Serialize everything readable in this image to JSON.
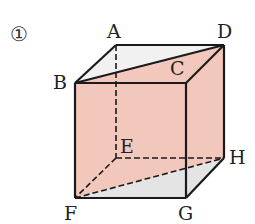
{
  "figure": {
    "number_label": "①",
    "colors": {
      "shaded_plane": "#f2c8bc",
      "grey_face": "#e4e4e4",
      "light_face": "#f1f1f1",
      "edge": "#1a1a1a"
    },
    "vertices": {
      "A": {
        "label": "A",
        "x": 116,
        "y": 45
      },
      "B": {
        "label": "B",
        "x": 75,
        "y": 83
      },
      "C": {
        "label": "C",
        "x": 186,
        "y": 83
      },
      "D": {
        "label": "D",
        "x": 224,
        "y": 45
      },
      "E": {
        "label": "E",
        "x": 116,
        "y": 158
      },
      "F": {
        "label": "F",
        "x": 75,
        "y": 198
      },
      "G": {
        "label": "G",
        "x": 186,
        "y": 198
      },
      "H": {
        "label": "H",
        "x": 224,
        "y": 158
      }
    },
    "shaded_section": "BDHF"
  }
}
